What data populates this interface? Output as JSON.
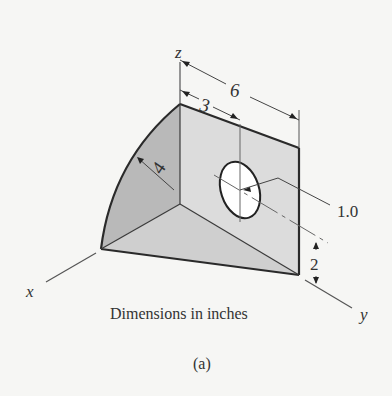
{
  "figure": {
    "axes": {
      "x": "x",
      "y": "y",
      "z": "z"
    },
    "dimensions": {
      "overall_length": "6",
      "hole_offset": "3",
      "radius": "4",
      "hole_diameter": "1.0",
      "hole_height": "2"
    },
    "units_note": "Dimensions in inches",
    "caption": "(a)",
    "colors": {
      "face_left": "#b9b9b9",
      "face_top": "#d2d2d2",
      "face_right": "#dcdcdc",
      "edge": "#2a2a2a",
      "dim_line": "#555555"
    }
  }
}
